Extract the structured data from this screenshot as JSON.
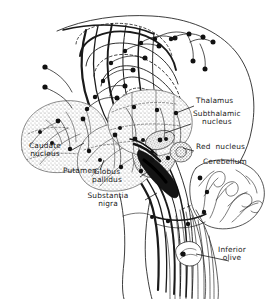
{
  "figure": {
    "background_color": "#ffffff",
    "ink_color": "#1a1a1a",
    "stipple_color": "#9a9a9a"
  },
  "labels": [
    {
      "id": "thalamus",
      "text": "Thalamus",
      "text2": "",
      "x": 196,
      "y": 101,
      "align": "lft",
      "leader": {
        "x1": 194,
        "y1": 106,
        "x2": 176,
        "y2": 113
      }
    },
    {
      "id": "subthalamic-nucleus",
      "text": "Subthalamic",
      "text2": "nucleus",
      "x": 193,
      "y": 114,
      "align": "ctr",
      "leader": {
        "x1": 191,
        "y1": 124,
        "x2": 165,
        "y2": 133
      }
    },
    {
      "id": "red-nucleus",
      "text": "Red  nucleus",
      "text2": "",
      "x": 196,
      "y": 147,
      "align": "lft",
      "leader": {
        "x1": 194,
        "y1": 151,
        "x2": 183,
        "y2": 148
      }
    },
    {
      "id": "cerebellum",
      "text": "Cerebellum",
      "text2": "",
      "x": 203,
      "y": 162,
      "align": "lft",
      "leader": null
    },
    {
      "id": "caudate-nucleus",
      "text": "Caudate",
      "text2": "nucleus",
      "x": 42,
      "y": 146,
      "align": "ctr",
      "leader": {
        "x1": 72,
        "y1": 150,
        "x2": 84,
        "y2": 143
      }
    },
    {
      "id": "putamen",
      "text": "Putamen",
      "text2": "",
      "x": 63,
      "y": 171,
      "align": "lft",
      "leader": {
        "x1": 100,
        "y1": 170,
        "x2": 104,
        "y2": 160
      }
    },
    {
      "id": "globus-pallidus",
      "text": "Globus",
      "text2": "pallidus",
      "x": 105,
      "y": 172,
      "align": "ctr",
      "leader": {
        "x1": 140,
        "y1": 177,
        "x2": 150,
        "y2": 170
      }
    },
    {
      "id": "substantia-nigra",
      "text": "Substantia",
      "text2": "nigra",
      "x": 107,
      "y": 196,
      "align": "ctr",
      "leader": {
        "x1": 145,
        "y1": 200,
        "x2": 157,
        "y2": 193
      }
    },
    {
      "id": "inferior-olive",
      "text": "Inferior",
      "text2": "olive",
      "x": 231,
      "y": 250,
      "align": "ctr",
      "leader": {
        "x1": 229,
        "y1": 261,
        "x2": 196,
        "y2": 254
      }
    }
  ],
  "structures": [
    {
      "id": "cerebral-outline",
      "name": "cerebral hemisphere outline",
      "style": "thin-contour"
    },
    {
      "id": "caudate-body",
      "name": "caudate nucleus",
      "style": "stippled"
    },
    {
      "id": "putamen-body",
      "name": "putamen",
      "style": "stippled"
    },
    {
      "id": "globus-pallidus-body",
      "name": "globus pallidus",
      "style": "stippled"
    },
    {
      "id": "thalamus-body",
      "name": "thalamus",
      "style": "stippled"
    },
    {
      "id": "subthalamic-body",
      "name": "subthalamic nucleus",
      "style": "stippled-small"
    },
    {
      "id": "substantia-nigra-body",
      "name": "substantia nigra",
      "style": "solid-dark"
    },
    {
      "id": "red-nucleus-body",
      "name": "red nucleus",
      "style": "stippled-small"
    },
    {
      "id": "cerebellum-body",
      "name": "cerebellum arbor vitae",
      "style": "foliated"
    },
    {
      "id": "brainstem-body",
      "name": "brainstem",
      "style": "thin-contour"
    },
    {
      "id": "inferior-olive-body",
      "name": "inferior olive",
      "style": "stippled-small"
    },
    {
      "id": "corona-radiata",
      "name": "corona radiata fiber fan",
      "style": "fibers"
    },
    {
      "id": "descending-tracts",
      "name": "descending corticospinal tracts",
      "style": "fibers"
    }
  ]
}
